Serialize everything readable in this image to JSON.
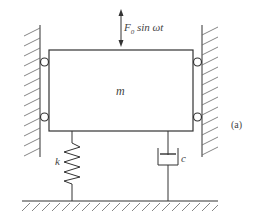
{
  "diagram": {
    "type": "mass-spring-damper system with harmonic forcing",
    "panel_label": "(a)",
    "mass": {
      "label": "m"
    },
    "force": {
      "label_main": "F",
      "label_sub": "0",
      "label_rest": " sin ωt",
      "direction": "vertical, bidirectional"
    },
    "spring": {
      "label": "k"
    },
    "damper": {
      "label": "c"
    },
    "walls": [
      "left fixed wall with rollers",
      "right fixed wall with rollers"
    ],
    "ground": "fixed ground",
    "rollers": 4,
    "colors": {
      "line": "#333333",
      "text": "#444444",
      "background": "#ffffff"
    }
  }
}
